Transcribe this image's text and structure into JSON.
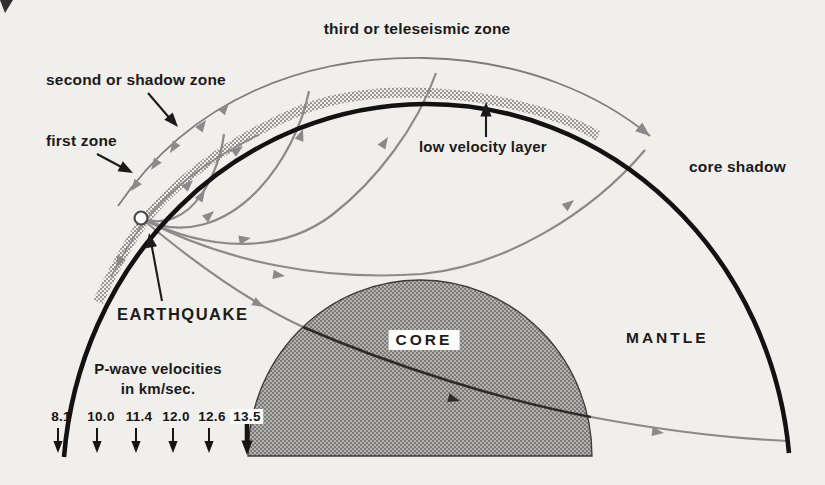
{
  "labels": {
    "third_zone": "third or teleseismic zone",
    "second_zone": "second or shadow zone",
    "first_zone": "first zone",
    "low_velocity_layer": "low velocity layer",
    "core_shadow": "core shadow",
    "earthquake": "EARTHQUAKE",
    "core": "CORE",
    "mantle": "MANTLE"
  },
  "velocity_scale": {
    "caption_line1": "P-wave velocities",
    "caption_line2": "in km/sec.",
    "unit": "km/sec",
    "values": [
      "8.1",
      "10.0",
      "11.4",
      "12.0",
      "12.6",
      "13.5"
    ]
  },
  "colors": {
    "background": "#f1efeb",
    "ink": "#1b1b1b",
    "ray_gray": "#8a8a8a",
    "core_ray_dark": "#2b2b2b",
    "core_halftone_base": "#b3b1ad",
    "core_halftone_dot": "#737373",
    "band_stipple_dot": "#8e8c89",
    "label_chip": "#fdfdfb"
  }
}
